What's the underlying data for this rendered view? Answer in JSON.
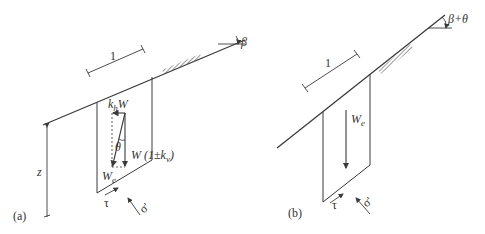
{
  "panel_a": {
    "caption": "(a)",
    "slope_angle_label": "β",
    "length_label": "1",
    "depth_label": "z",
    "horizontal_force_label": {
      "base": "k",
      "sub": "h",
      "tail": "W"
    },
    "angle_label": "θ",
    "vertical_force_label": {
      "head": "W (1±k",
      "sub": "v",
      "tail": ")"
    },
    "resultant_label": {
      "base": "W",
      "sub": "e"
    },
    "shear_label": "τ",
    "normal_label": "σ'"
  },
  "panel_b": {
    "caption": "(b)",
    "slope_angle_label": "β+θ",
    "length_label": "1",
    "resultant_label": {
      "base": "W",
      "sub": "e"
    },
    "shear_label": "τ",
    "normal_label": "σ'"
  },
  "colors": {
    "line": "#3a3a3a",
    "background": "#ffffff"
  }
}
